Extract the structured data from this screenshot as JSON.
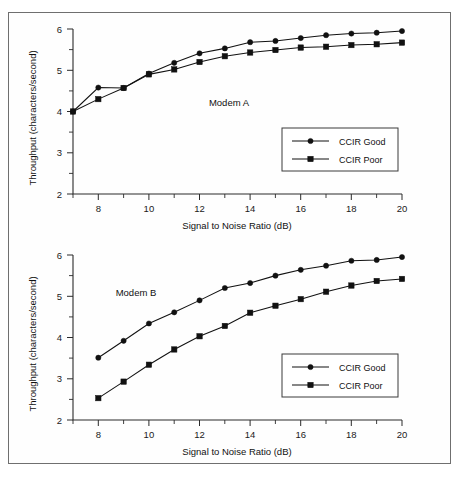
{
  "figure": {
    "background_color": "#ffffff",
    "border_color": "#6f6f6f",
    "line_color": "#111111"
  },
  "chart_data": [
    {
      "type": "line",
      "id": "modem-a",
      "title": "",
      "annotation": "Modem A",
      "xlabel": "Signal to Noise Ratio (dB)",
      "ylabel": "Throughput (characters/second)",
      "xlim": [
        7,
        20
      ],
      "ylim": [
        2,
        6
      ],
      "xticks": [
        8,
        10,
        12,
        14,
        16,
        18,
        20
      ],
      "xticklabels": [
        "8",
        "10",
        "12",
        "14",
        "16",
        "18",
        "20"
      ],
      "xminorticks": [
        7,
        9,
        11,
        13,
        15,
        17,
        19
      ],
      "yticks": [
        2,
        3,
        4,
        5,
        6
      ],
      "yticklabels": [
        "2",
        "3",
        "4",
        "5",
        "6"
      ],
      "yminorticks": [
        2.5,
        3.5,
        4.5,
        5.5
      ],
      "grid": false,
      "legend_position": "lower right",
      "x": [
        7,
        8,
        9,
        10,
        11,
        12,
        13,
        14,
        15,
        16,
        17,
        18,
        19,
        20
      ],
      "series": [
        {
          "name": "CCIR Good",
          "marker": "circle",
          "values": [
            4.0,
            4.58,
            4.57,
            4.92,
            5.18,
            5.41,
            5.53,
            5.68,
            5.71,
            5.78,
            5.85,
            5.89,
            5.91,
            5.95
          ]
        },
        {
          "name": "CCIR Poor",
          "marker": "square",
          "values": [
            4.0,
            4.3,
            4.57,
            4.9,
            5.02,
            5.2,
            5.34,
            5.43,
            5.49,
            5.55,
            5.57,
            5.61,
            5.63,
            5.67
          ]
        }
      ]
    },
    {
      "type": "line",
      "id": "modem-b",
      "title": "",
      "annotation": "Modem B",
      "xlabel": "Signal to Noise Ratio (dB)",
      "ylabel": "Throughput (characters/second)",
      "xlim": [
        7,
        20
      ],
      "ylim": [
        2,
        6
      ],
      "xticks": [
        8,
        10,
        12,
        14,
        16,
        18,
        20
      ],
      "xticklabels": [
        "8",
        "10",
        "12",
        "14",
        "16",
        "18",
        "20"
      ],
      "xminorticks": [
        7,
        9,
        11,
        13,
        15,
        17,
        19
      ],
      "yticks": [
        2,
        3,
        4,
        5,
        6
      ],
      "yticklabels": [
        "2",
        "3",
        "4",
        "5",
        "6"
      ],
      "yminorticks": [
        2.5,
        3.5,
        4.5,
        5.5
      ],
      "grid": false,
      "legend_position": "lower right",
      "x": [
        8,
        9,
        10,
        11,
        12,
        13,
        14,
        15,
        16,
        17,
        18,
        19,
        20
      ],
      "series": [
        {
          "name": "CCIR Good",
          "marker": "circle",
          "values": [
            3.51,
            3.92,
            4.34,
            4.61,
            4.9,
            5.2,
            5.32,
            5.5,
            5.64,
            5.74,
            5.86,
            5.88,
            5.95
          ]
        },
        {
          "name": "CCIR Poor",
          "marker": "square",
          "values": [
            2.53,
            2.93,
            3.34,
            3.71,
            4.03,
            4.28,
            4.6,
            4.77,
            4.93,
            5.11,
            5.26,
            5.37,
            5.42
          ]
        }
      ]
    }
  ]
}
